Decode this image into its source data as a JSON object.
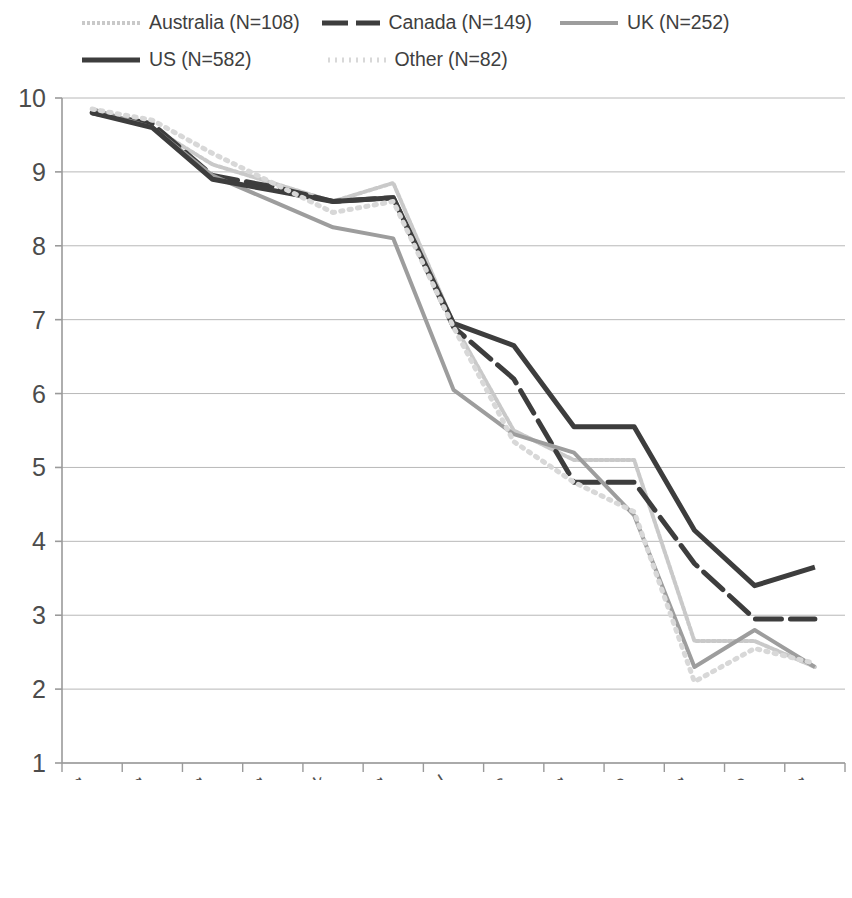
{
  "chart_data": {
    "type": "line",
    "title": "",
    "xlabel": "",
    "ylabel": "",
    "ylim": [
      1,
      10
    ],
    "yticks": [
      1,
      2,
      3,
      4,
      5,
      6,
      7,
      8,
      9,
      10
    ],
    "grid": true,
    "legend_position": "top",
    "categories": [
      "Listening",
      "Questioning",
      "Reflecting",
      "Summarising",
      "Giving feedback",
      "Paraphrasing",
      "Being a role model",
      "Providing ideas",
      "Explaining",
      "Offering guidance",
      "Instructing",
      "Giving advice",
      "Telling"
    ],
    "series": [
      {
        "name": "Australia (N=108)",
        "legend_label": "Australia (N=108)",
        "color": "#c9c9c9",
        "style": "dense-dotted",
        "width": 4,
        "values": [
          9.85,
          9.6,
          9.1,
          8.85,
          8.6,
          8.85,
          6.95,
          5.5,
          5.1,
          5.1,
          2.65,
          2.65,
          2.3
        ]
      },
      {
        "name": "Canada (N=149)",
        "legend_label": "Canada (N=149)",
        "color": "#3d3d3d",
        "style": "dashed",
        "width": 5,
        "values": [
          9.8,
          9.65,
          8.95,
          8.8,
          8.6,
          8.65,
          6.9,
          6.2,
          4.8,
          4.8,
          3.7,
          2.95,
          2.95
        ]
      },
      {
        "name": "UK (N=252)",
        "legend_label": "UK (N=252)",
        "color": "#9d9d9d",
        "style": "solid",
        "width": 4,
        "values": [
          9.85,
          9.6,
          8.95,
          8.6,
          8.25,
          8.1,
          6.05,
          5.45,
          5.2,
          4.35,
          2.3,
          2.8,
          2.3
        ]
      },
      {
        "name": "US (N=582)",
        "legend_label": "US (N=582)",
        "color": "#3d3d3d",
        "style": "solid",
        "width": 5,
        "values": [
          9.8,
          9.6,
          8.9,
          8.75,
          8.6,
          8.65,
          6.95,
          6.65,
          5.55,
          5.55,
          4.15,
          3.4,
          3.65
        ]
      },
      {
        "name": "Other (N=82)",
        "legend_label": "Other (N=82)",
        "color": "#d8d8d8",
        "style": "dotted",
        "width": 5,
        "values": [
          9.85,
          9.7,
          9.25,
          8.85,
          8.45,
          8.6,
          6.9,
          5.35,
          4.8,
          4.4,
          2.1,
          2.55,
          2.35
        ]
      }
    ]
  },
  "axis": {
    "y_tick_labels": [
      "10",
      "9",
      "8",
      "7",
      "6",
      "5",
      "4",
      "3",
      "2",
      "1"
    ]
  }
}
